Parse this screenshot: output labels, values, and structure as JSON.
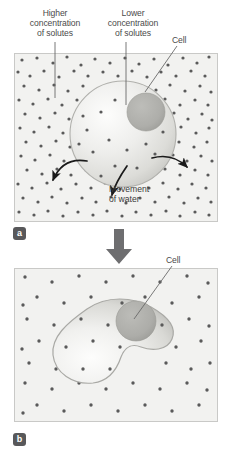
{
  "figure": {
    "type": "diagram",
    "topic": "Osmosis: cell in hypertonic solution shrinks (crenation)"
  },
  "labels": {
    "higher_concentration": "Higher\nconcentration\nof solutes",
    "lower_concentration": "Lower\nconcentration\nof solutes",
    "cell_a": "Cell",
    "cell_b": "Cell",
    "movement_of_water": "Movement\nof water"
  },
  "panels": [
    {
      "id": "a",
      "badge": "a",
      "description": "Round cell with nucleus in solution of higher solute concentration outside",
      "solute_dot_density": "high",
      "cell_shape": "round",
      "arrows": [
        {
          "name": "water-out-left",
          "direction": "down-left"
        },
        {
          "name": "water-out-right",
          "direction": "right"
        },
        {
          "name": "water-out-bottom",
          "direction": "down"
        }
      ]
    },
    {
      "id": "b",
      "badge": "b",
      "description": "Shrunken, crenated cell after water has left",
      "solute_dot_density": "low",
      "cell_shape": "irregular-shrunken",
      "arrows": []
    }
  ],
  "colors": {
    "panel_background": "#f2f2f0",
    "panel_border": "#c9c9c7",
    "solute_dot": "#5a5a5a",
    "cell_fill_light": "#f6f6f4",
    "cell_fill_mid": "#d8d8d4",
    "cell_edge": "#a8a8a4",
    "nucleus": "#aeaeaa",
    "arrow_dark": "#1a1a1a",
    "transition_arrow": "#6e6e70",
    "badge_background": "#58585a",
    "badge_text": "#ffffff",
    "text": "#4a4a4a",
    "leader_line": "#6a6a6a"
  },
  "transition": {
    "name": "downward-transition-arrow",
    "from_panel": "a",
    "to_panel": "b"
  }
}
